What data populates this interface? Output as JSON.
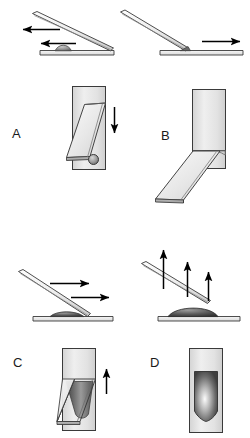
{
  "figure": {
    "type": "scientific-schematic",
    "background_color": "#ffffff",
    "line_color": "#3a3a3a",
    "arrow_color": "#000000",
    "width": 250,
    "height": 438,
    "panel_count": 4
  },
  "panels": [
    {
      "id": "A",
      "label": "A",
      "label_position": {
        "x": 12,
        "y": 126
      },
      "top_view": {
        "description": "tilted-rod-resting-on-base-with-bump",
        "rod_orientation": "high-left-low-right",
        "base_feature": "dome-bump-centered",
        "arrows": [
          {
            "name": "arrow-left-upper",
            "direction": "left",
            "x1": 60,
            "y1": 29,
            "x2": 22,
            "y2": 29
          },
          {
            "name": "arrow-left-lower",
            "direction": "left",
            "x1": 75,
            "y1": 43,
            "x2": 40,
            "y2": 43
          }
        ]
      },
      "bottom_view": {
        "description": "vertical-channel-with-slanted-plate-and-ball",
        "channel": {
          "x": 72,
          "y": 86,
          "w": 34,
          "h": 84
        },
        "plate_angle": "down-left",
        "inner_feature": "small-circle-ball",
        "arrows": [
          {
            "name": "arrow-down",
            "direction": "down",
            "x1": 114,
            "y1": 108,
            "x2": 114,
            "y2": 133
          }
        ]
      }
    },
    {
      "id": "B",
      "label": "B",
      "label_position": {
        "x": 161,
        "y": 128
      },
      "top_view": {
        "description": "tilted-rod-pivoting-on-flat-base",
        "rod_orientation": "high-left-low-right-touching-base",
        "base_feature": "flat-plate",
        "arrows": [
          {
            "name": "arrow-right",
            "direction": "right",
            "x1": 202,
            "y1": 42,
            "x2": 240,
            "y2": 42
          }
        ]
      },
      "bottom_view": {
        "description": "vertical-channel-with-plate-swung-out-down-left",
        "channel": {
          "x": 192,
          "y": 89,
          "w": 34,
          "h": 80
        },
        "plate_angle": "swung-out-down-left",
        "inner_feature": "concave-meniscus",
        "arrows": []
      }
    },
    {
      "id": "C",
      "label": "C",
      "label_position": {
        "x": 13,
        "y": 355
      },
      "top_view": {
        "description": "tilted-rod-lifting-off-base",
        "rod_orientation": "high-left-low-right",
        "base_feature": "flat-plate-with-flattened-bump",
        "arrows": [
          {
            "name": "arrow-right-upper",
            "direction": "right",
            "x1": 50,
            "y1": 283,
            "x2": 88,
            "y2": 283
          },
          {
            "name": "arrow-right-lower",
            "direction": "right",
            "x1": 72,
            "y1": 297,
            "x2": 108,
            "y2": 297
          }
        ]
      },
      "bottom_view": {
        "description": "vertical-channel-with-slanted-plate-and-dark-fluid",
        "channel": {
          "x": 62,
          "y": 348,
          "w": 34,
          "h": 82
        },
        "plate_angle": "down-left",
        "inner_feature": "dark-gradient-fluid-column",
        "arrows": [
          {
            "name": "arrow-up",
            "direction": "up",
            "x1": 106,
            "y1": 393,
            "x2": 106,
            "y2": 368
          }
        ]
      }
    },
    {
      "id": "D",
      "label": "D",
      "label_position": {
        "x": 150,
        "y": 355
      },
      "top_view": {
        "description": "tilted-rod-floating-above-base",
        "rod_orientation": "high-left-low-right-detached",
        "base_feature": "flat-plate-with-dark-dome",
        "arrows": [
          {
            "name": "arrow-up-left",
            "direction": "up",
            "x1": 163,
            "y1": 288,
            "x2": 163,
            "y2": 250
          },
          {
            "name": "arrow-up-center",
            "direction": "up",
            "x1": 187,
            "y1": 296,
            "x2": 187,
            "y2": 262
          },
          {
            "name": "arrow-up-right",
            "direction": "up",
            "x1": 208,
            "y1": 300,
            "x2": 208,
            "y2": 272
          }
        ]
      },
      "bottom_view": {
        "description": "vertical-channel-with-rounded-dark-fluid-body",
        "channel": {
          "x": 189,
          "y": 348,
          "w": 34,
          "h": 84
        },
        "plate_angle": "none",
        "inner_feature": "dark-radial-gradient-droplet",
        "arrows": []
      }
    }
  ],
  "colors": {
    "outline": "#3a3a3a",
    "outline_dark": "#2b2b2b",
    "fill_light": "#eeeeee",
    "fill_mid": "#dcdcdc",
    "fill_plate": "#e6e6e6",
    "fluid_dark": "#4a4a4a",
    "fluid_mid": "#8a8a8a",
    "fluid_light": "#fafafa",
    "arrow": "#000000",
    "label_text": "#1a1a1a"
  }
}
